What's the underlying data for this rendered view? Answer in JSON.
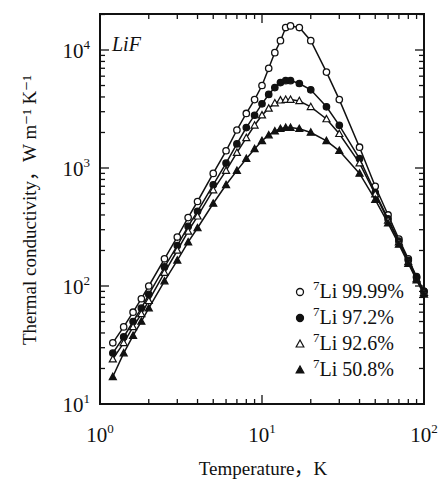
{
  "chart_data": {
    "type": "line",
    "title": "",
    "annotation": "LiF",
    "xlabel": "Temperature，K",
    "ylabel": "Thermal conductivity，W m⁻¹ K⁻¹",
    "xscale": "log",
    "yscale": "log",
    "xlim": [
      1,
      100
    ],
    "ylim": [
      10,
      20000
    ],
    "xticks": [
      {
        "base": "10",
        "exp": "0",
        "value": 1
      },
      {
        "base": "10",
        "exp": "1",
        "value": 10
      },
      {
        "base": "10",
        "exp": "2",
        "value": 100
      }
    ],
    "yticks": [
      {
        "base": "10",
        "exp": "1",
        "value": 10
      },
      {
        "base": "10",
        "exp": "2",
        "value": 100
      },
      {
        "base": "10",
        "exp": "3",
        "value": 1000
      },
      {
        "base": "10",
        "exp": "4",
        "value": 10000
      }
    ],
    "legend_position": "bottom-right",
    "grid": false,
    "x": [
      1.2,
      1.4,
      1.6,
      1.8,
      2,
      2.5,
      3,
      3.5,
      4,
      5,
      6,
      7,
      8,
      9,
      10,
      11,
      12,
      13,
      14,
      15,
      17,
      20,
      25,
      30,
      40,
      50,
      60,
      70,
      80,
      90,
      100
    ],
    "series": [
      {
        "name": "⁷Li 99.99%",
        "sup": "7",
        "label": "Li 99.99%",
        "marker": "open-circle",
        "values": [
          33,
          45,
          60,
          78,
          100,
          170,
          260,
          380,
          520,
          900,
          1400,
          2100,
          2900,
          3800,
          5000,
          7000,
          9500,
          12000,
          15500,
          16000,
          15500,
          12000,
          6500,
          3800,
          1500,
          700,
          400,
          250,
          170,
          120,
          90
        ]
      },
      {
        "name": "⁷Li 97.2%",
        "sup": "7",
        "label": "Li 97.2%",
        "marker": "filled-circle",
        "values": [
          27,
          37,
          50,
          65,
          85,
          145,
          220,
          320,
          430,
          720,
          1100,
          1600,
          2200,
          2800,
          3500,
          4200,
          4800,
          5300,
          5500,
          5500,
          5200,
          4600,
          3300,
          2300,
          1200,
          620,
          370,
          240,
          165,
          118,
          90
        ]
      },
      {
        "name": "⁷Li 92.6%",
        "sup": "7",
        "label": "Li 92.6%",
        "marker": "open-triangle",
        "values": [
          24,
          33,
          45,
          58,
          75,
          130,
          200,
          290,
          390,
          650,
          950,
          1350,
          1800,
          2300,
          2800,
          3200,
          3550,
          3750,
          3800,
          3800,
          3700,
          3300,
          2600,
          1950,
          1100,
          600,
          360,
          235,
          160,
          115,
          88
        ]
      },
      {
        "name": "⁷Li 50.8%",
        "sup": "7",
        "label": "Li 50.8%",
        "marker": "filled-triangle",
        "values": [
          17,
          27,
          38,
          50,
          65,
          110,
          165,
          235,
          310,
          500,
          720,
          950,
          1200,
          1450,
          1700,
          1900,
          2050,
          2150,
          2200,
          2200,
          2150,
          2000,
          1700,
          1400,
          900,
          540,
          340,
          225,
          155,
          112,
          85
        ]
      }
    ]
  }
}
